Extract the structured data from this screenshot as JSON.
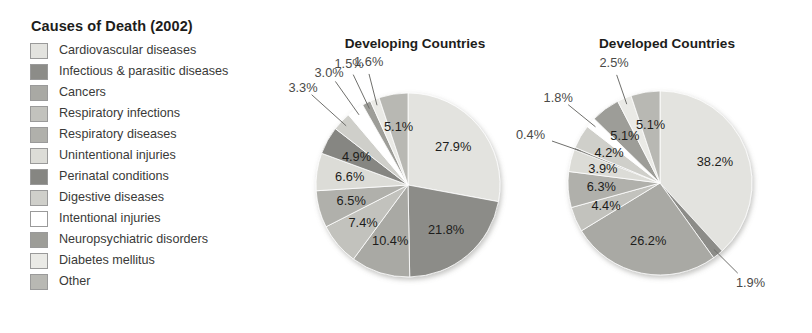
{
  "legend": {
    "title": "Causes of Death (2002)",
    "items": [
      {
        "label": "Cardiovascular diseases",
        "color": "#e3e3df"
      },
      {
        "label": "Infectious & parasitic diseases",
        "color": "#8c8c88"
      },
      {
        "label": "Cancers",
        "color": "#a9a9a4"
      },
      {
        "label": "Respiratory infections",
        "color": "#c2c2bd"
      },
      {
        "label": "Respiratory diseases",
        "color": "#b0b0ab"
      },
      {
        "label": "Unintentional injuries",
        "color": "#dcdcd7"
      },
      {
        "label": "Perinatal conditions",
        "color": "#868682"
      },
      {
        "label": "Digestive diseases",
        "color": "#cfcfca"
      },
      {
        "label": "Intentional injuries",
        "color": "#ffffff"
      },
      {
        "label": "Neuropsychiatric disorders",
        "color": "#9d9d98"
      },
      {
        "label": "Diabetes mellitus",
        "color": "#eaeae6"
      },
      {
        "label": "Other",
        "color": "#b8b8b3"
      }
    ]
  },
  "chart_data": [
    {
      "type": "pie",
      "title": "Developing Countries",
      "categories": [
        "Cardiovascular diseases",
        "Infectious & parasitic diseases",
        "Cancers",
        "Respiratory infections",
        "Respiratory diseases",
        "Unintentional injuries",
        "Perinatal conditions",
        "Digestive diseases",
        "Intentional injuries",
        "Neuropsychiatric disorders",
        "Diabetes mellitus",
        "Other"
      ],
      "values": [
        27.9,
        21.8,
        10.4,
        7.4,
        6.5,
        6.6,
        4.9,
        3.3,
        3.0,
        1.5,
        1.6,
        5.1
      ],
      "labels": [
        "27.9%",
        "21.8%",
        "10.4%",
        "7.4%",
        "6.5%",
        "6.6%",
        "4.9%",
        "3.3%",
        "3.0%",
        "1.5%",
        "1.6%",
        "5.1%"
      ],
      "colors": [
        "#e3e3df",
        "#8c8c88",
        "#a9a9a4",
        "#c2c2bd",
        "#b0b0ab",
        "#dcdcd7",
        "#868682",
        "#cfcfca",
        "#ffffff",
        "#9d9d98",
        "#eaeae6",
        "#b8b8b3"
      ],
      "legend_position": "left",
      "units": "percent"
    },
    {
      "type": "pie",
      "title": "Developed Countries",
      "categories": [
        "Cardiovascular diseases",
        "Infectious & parasitic diseases",
        "Cancers",
        "Respiratory infections",
        "Respiratory diseases",
        "Unintentional injuries",
        "Perinatal conditions",
        "Digestive diseases",
        "Intentional injuries",
        "Neuropsychiatric disorders",
        "Diabetes mellitus",
        "Other"
      ],
      "values": [
        38.2,
        1.9,
        26.2,
        4.4,
        6.3,
        3.9,
        0.4,
        4.2,
        1.8,
        5.1,
        2.5,
        5.1
      ],
      "labels": [
        "38.2%",
        "1.9%",
        "26.2%",
        "4.4%",
        "6.3%",
        "3.9%",
        "0.4%",
        "4.2%",
        "1.8%",
        "5.1%",
        "2.5%",
        "5.1%"
      ],
      "colors": [
        "#e3e3df",
        "#8c8c88",
        "#a9a9a4",
        "#c2c2bd",
        "#b0b0ab",
        "#dcdcd7",
        "#868682",
        "#cfcfca",
        "#ffffff",
        "#9d9d98",
        "#eaeae6",
        "#b8b8b3"
      ],
      "legend_position": "left",
      "units": "percent"
    }
  ]
}
